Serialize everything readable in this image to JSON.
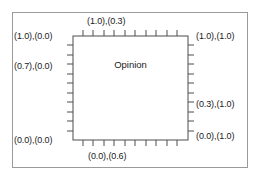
{
  "figure": {
    "region_label": "Opinion",
    "labels": {
      "top_left": "(1.0),(0.0)",
      "top_center": "(1.0),(0.3)",
      "top_right": "(1.0),(1.0)",
      "left_middle": "(0.7),(0.0)",
      "right_middle": "(0.3),(1.0)",
      "right_lower": "(0.0),(1.0)",
      "bottom_left": "(0.0),(0.0)",
      "bottom_center": "(0.0),(0.6)"
    },
    "colors": {
      "frame_stroke": "#9a9a9a",
      "box_stroke": "#4d4d4d",
      "tick_stroke": "#4d4d4d",
      "text": "#1a1a1a",
      "background": "#ffffff"
    },
    "geometry": {
      "outer_frame": {
        "x": 12,
        "y": 12,
        "width": 236,
        "height": 156
      },
      "inner_box": {
        "x": 73,
        "y": 36,
        "width": 115,
        "height": 104
      },
      "tick_length": 6,
      "ticks_per_edge": 10,
      "tick_direction": "outward"
    }
  }
}
